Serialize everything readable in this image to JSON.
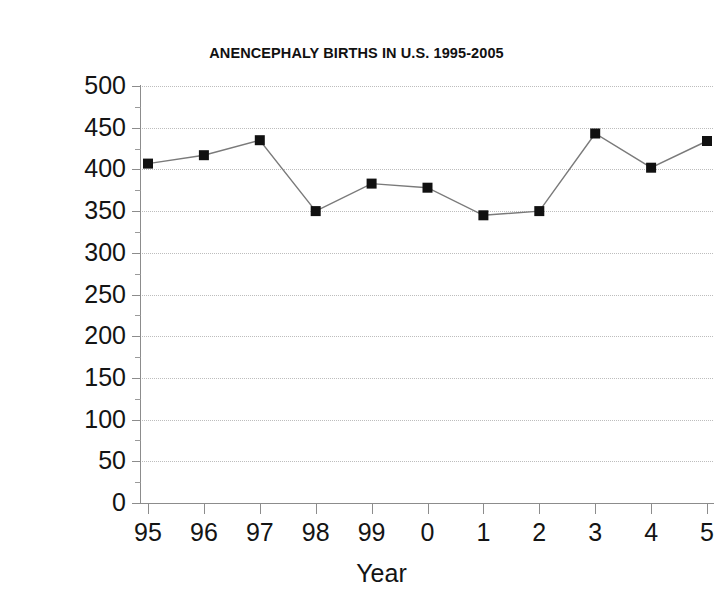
{
  "scan": {
    "top_artifact_text": " "
  },
  "chart_data": {
    "type": "line",
    "title": "ANENCEPHALY BIRTHS IN U.S. 1995-2005",
    "xlabel": "Year",
    "ylabel": "",
    "categories": [
      "95",
      "96",
      "97",
      "98",
      "99",
      "0",
      "1",
      "2",
      "3",
      "4",
      "5"
    ],
    "values": [
      407,
      417,
      435,
      350,
      383,
      378,
      345,
      350,
      443,
      402,
      434
    ],
    "series": [
      {
        "name": "Anencephaly births",
        "values": [
          407,
          417,
          435,
          350,
          383,
          378,
          345,
          350,
          443,
          402,
          434
        ]
      }
    ],
    "ylim": [
      0,
      500
    ],
    "ytick_labels": [
      "500",
      "450",
      "400",
      "350",
      "300",
      "250",
      "200",
      "150",
      "100",
      "50",
      "0"
    ],
    "ytick_values": [
      500,
      450,
      400,
      350,
      300,
      250,
      200,
      150,
      100,
      50,
      0
    ],
    "ytick_step": 50,
    "yminor_step": 25,
    "xtick_labels": [
      "95",
      "96",
      "97",
      "98",
      "99",
      "0",
      "1",
      "2",
      "3",
      "4",
      "5"
    ],
    "grid": "horizontal-dotted",
    "legend": "none",
    "marker": "filled-square",
    "line_color": "#7a7a7a",
    "marker_color": "#111111",
    "grid_color": "#bdbdbd",
    "axis_color": "#8c8c8c",
    "background": "#ffffff"
  }
}
